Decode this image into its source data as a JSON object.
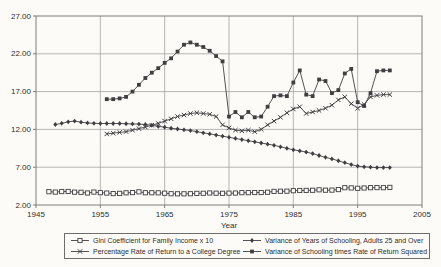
{
  "chart_data": {
    "type": "line",
    "title": "",
    "xlabel": "Year",
    "ylabel": "",
    "xlim": [
      1945,
      2005
    ],
    "ylim": [
      2,
      27
    ],
    "grid": true,
    "legend_position": "bottom",
    "x_ticks": [
      {
        "value": 1945,
        "label": "1945"
      },
      {
        "value": 1955,
        "label": "1955"
      },
      {
        "value": 1965,
        "label": "1965"
      },
      {
        "value": 1975,
        "label": "1975"
      },
      {
        "value": 1985,
        "label": "1985"
      },
      {
        "value": 1995,
        "label": "1995"
      },
      {
        "value": 2005,
        "label": "2005"
      }
    ],
    "y_ticks": [
      {
        "value": 27,
        "label": "27.00"
      },
      {
        "value": 22,
        "label": "22.00"
      },
      {
        "value": 17,
        "label": "17.00"
      },
      {
        "value": 12,
        "label": "12.00"
      },
      {
        "value": 7,
        "label": "7.00"
      },
      {
        "value": 2,
        "label": "2.00"
      }
    ],
    "colors": {
      "line": "#3f3f3f",
      "grid": "#a3a3a3",
      "frame": "#7d7d7d",
      "text": "#2e2e2e",
      "background": "#fcfbf8"
    },
    "series": [
      {
        "name": "Gini Coefficient for Family Income x 10",
        "marker": "open-square",
        "start_year": 1947,
        "values": [
          3.76,
          3.71,
          3.78,
          3.79,
          3.7,
          3.68,
          3.59,
          3.71,
          3.63,
          3.58,
          3.51,
          3.54,
          3.61,
          3.64,
          3.74,
          3.62,
          3.62,
          3.61,
          3.56,
          3.49,
          3.48,
          3.48,
          3.49,
          3.54,
          3.55,
          3.59,
          3.56,
          3.55,
          3.57,
          3.58,
          3.63,
          3.63,
          3.65,
          3.65,
          3.69,
          3.8,
          3.82,
          3.83,
          3.89,
          3.92,
          3.93,
          3.95,
          4.01,
          3.96,
          3.97,
          4.04,
          4.29,
          4.26,
          4.21,
          4.25,
          4.29,
          4.3,
          4.29,
          4.33
        ]
      },
      {
        "name": "Percentage Rate of Return to a College Degree",
        "marker": "x-cross",
        "start_year": 1956,
        "values": [
          11.4,
          11.5,
          11.6,
          11.7,
          11.9,
          12.1,
          12.3,
          12.55,
          12.8,
          13.1,
          13.4,
          13.7,
          13.9,
          14.1,
          14.2,
          14.1,
          14.0,
          13.7,
          12.6,
          12.2,
          11.9,
          11.8,
          11.9,
          11.7,
          12.0,
          12.6,
          13.1,
          13.6,
          14.2,
          14.7,
          15.0,
          14.1,
          14.3,
          14.5,
          14.8,
          15.2,
          15.9,
          16.3,
          15.4,
          14.8,
          15.3,
          16.3,
          16.5,
          16.6,
          16.6
        ]
      },
      {
        "name": "Variance of Years of Schooling, Adults 25 and Over",
        "marker": "diamond",
        "start_year": 1948,
        "values": [
          12.65,
          12.8,
          13.0,
          13.1,
          12.95,
          12.85,
          12.8,
          12.78,
          12.78,
          12.78,
          12.78,
          12.75,
          12.72,
          12.7,
          12.65,
          12.55,
          12.4,
          12.3,
          12.15,
          12.05,
          11.95,
          11.85,
          11.7,
          11.55,
          11.4,
          11.25,
          11.1,
          10.95,
          10.8,
          10.65,
          10.5,
          10.35,
          10.2,
          10.05,
          9.9,
          9.7,
          9.5,
          9.3,
          9.15,
          9.0,
          8.8,
          8.55,
          8.3,
          8.1,
          7.85,
          7.6,
          7.35,
          7.15,
          7.05,
          7.0,
          6.95,
          6.95,
          6.95
        ]
      },
      {
        "name": "Variance of Schooling times Rate of Return Squared",
        "marker": "filled-square",
        "start_year": 1956,
        "values": [
          16.0,
          16.0,
          16.1,
          16.3,
          17.0,
          17.9,
          18.8,
          19.5,
          20.1,
          20.8,
          21.4,
          22.3,
          23.2,
          23.5,
          23.2,
          22.9,
          22.4,
          21.7,
          21.0,
          13.7,
          14.3,
          13.6,
          14.3,
          13.6,
          13.7,
          15.0,
          16.4,
          16.5,
          16.4,
          18.2,
          19.8,
          16.6,
          16.4,
          18.6,
          18.4,
          16.8,
          17.2,
          19.4,
          20.0,
          15.6,
          15.1,
          16.8,
          19.7,
          19.8,
          19.8
        ]
      }
    ]
  }
}
